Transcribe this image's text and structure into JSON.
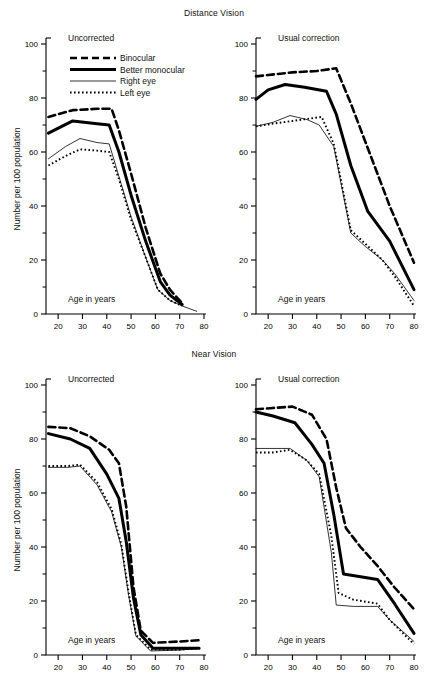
{
  "figure": {
    "width": 428,
    "height": 682,
    "background": "#ffffff",
    "ink": "#000000"
  },
  "sections": [
    {
      "title": "Distance Vision"
    },
    {
      "title": "Near Vision"
    }
  ],
  "panel_captions": {
    "uncorrected": "Uncorrected",
    "usual_correction": "Usual correction"
  },
  "axes": {
    "xlabel": "Age in years",
    "ylabel": "Number per 100 population",
    "xticks": [
      20,
      30,
      40,
      50,
      60,
      70,
      80
    ],
    "yticks": [
      0,
      20,
      40,
      60,
      80,
      100
    ],
    "yminorticks": [
      10,
      30,
      50,
      70,
      90
    ],
    "xlim": [
      15,
      80
    ],
    "ylim": [
      0,
      100
    ],
    "grid": false
  },
  "legend": {
    "position": "top-left-panel",
    "entries": [
      {
        "label": "Binocular",
        "style": "dashed-thick"
      },
      {
        "label": "Better monocular",
        "style": "solid-thick"
      },
      {
        "label": "Right eye",
        "style": "solid-thin"
      },
      {
        "label": "Left eye",
        "style": "dotted"
      }
    ]
  },
  "chart_data": [
    {
      "id": "distance-uncorrected",
      "type": "line",
      "title": "Distance Vision",
      "subtitle": "Uncorrected",
      "xlabel": "Age in years",
      "ylabel": "Number per 100 population",
      "xlim": [
        15,
        80
      ],
      "ylim": [
        0,
        100
      ],
      "grid": false,
      "series": [
        {
          "name": "Binocular",
          "style": "dashed-thick",
          "x": [
            16,
            26,
            36,
            42,
            45,
            50,
            56,
            62,
            66,
            71
          ],
          "y": [
            73,
            75.5,
            76,
            76,
            68,
            52,
            32,
            15,
            9,
            4
          ]
        },
        {
          "name": "Better monocular",
          "style": "solid-thick",
          "x": [
            16,
            26,
            36,
            41,
            45,
            50,
            56,
            62,
            66,
            71
          ],
          "y": [
            67,
            71.5,
            70.5,
            70,
            60,
            44,
            27,
            12,
            7,
            3.5
          ]
        },
        {
          "name": "Right eye",
          "style": "solid-thin",
          "x": [
            16,
            23,
            29,
            36,
            41,
            45,
            50,
            56,
            61,
            66,
            71,
            77
          ],
          "y": [
            57.5,
            62,
            65,
            63.5,
            63,
            51,
            36,
            21,
            9,
            5,
            3,
            1
          ]
        },
        {
          "name": "Left eye",
          "style": "dotted",
          "x": [
            16,
            23,
            29,
            36,
            41,
            45,
            50,
            56,
            61,
            66,
            71
          ],
          "y": [
            55,
            58.5,
            61,
            60.5,
            60,
            50,
            35,
            21,
            9,
            5,
            3
          ]
        }
      ]
    },
    {
      "id": "distance-usual-correction",
      "type": "line",
      "title": "Distance Vision",
      "subtitle": "Usual correction",
      "xlabel": "Age in years",
      "ylabel": "Number per 100 population",
      "xlim": [
        15,
        80
      ],
      "ylim": [
        0,
        100
      ],
      "grid": false,
      "series": [
        {
          "name": "Binocular",
          "style": "dashed-thick",
          "x": [
            15,
            20,
            30,
            40,
            48,
            54,
            62,
            70,
            80
          ],
          "y": [
            88,
            88.5,
            89.5,
            90,
            91,
            78,
            59,
            40,
            19
          ]
        },
        {
          "name": "Better monocular",
          "style": "solid-thick",
          "x": [
            15,
            20,
            27,
            35,
            44,
            48,
            54,
            61,
            70,
            80
          ],
          "y": [
            79.5,
            83,
            85,
            84,
            82.5,
            74,
            55,
            38,
            27,
            9
          ]
        },
        {
          "name": "Right eye",
          "style": "solid-thin",
          "x": [
            15,
            22,
            29,
            36,
            41,
            47,
            54,
            60,
            67,
            72,
            80
          ],
          "y": [
            69.5,
            71,
            73.5,
            72,
            70,
            62,
            30,
            25,
            20,
            15,
            5
          ]
        },
        {
          "name": "Left eye",
          "style": "dotted",
          "x": [
            15,
            22,
            30,
            38,
            42,
            47,
            54,
            60,
            67,
            72,
            80
          ],
          "y": [
            69.5,
            70.5,
            71.5,
            72.5,
            73,
            63,
            31,
            26,
            20,
            14,
            3
          ]
        }
      ]
    },
    {
      "id": "near-uncorrected",
      "type": "line",
      "title": "Near Vision",
      "subtitle": "Uncorrected",
      "xlabel": "Age in years",
      "ylabel": "Number per 100 population",
      "xlim": [
        15,
        80
      ],
      "ylim": [
        0,
        100
      ],
      "grid": false,
      "series": [
        {
          "name": "Binocular",
          "style": "dashed-thick",
          "x": [
            16,
            25,
            33,
            41,
            45,
            48,
            51,
            54,
            59,
            70,
            78
          ],
          "y": [
            84.5,
            84,
            81,
            76,
            71,
            55,
            25,
            9,
            4.5,
            5,
            5.5
          ]
        },
        {
          "name": "Better monocular",
          "style": "solid-thick",
          "x": [
            16,
            25,
            33,
            40,
            45,
            48,
            51,
            54,
            59,
            70,
            78
          ],
          "y": [
            82,
            80,
            76.5,
            67,
            58,
            42,
            21,
            7.5,
            2.5,
            2.5,
            2.5
          ]
        },
        {
          "name": "Right eye",
          "style": "solid-thin",
          "x": [
            16,
            24,
            29,
            36,
            42,
            46,
            49,
            52,
            58,
            70,
            78
          ],
          "y": [
            69.5,
            69.5,
            70,
            63,
            53,
            40,
            22,
            7,
            1.5,
            1.8,
            2.5
          ]
        },
        {
          "name": "Left eye",
          "style": "dotted",
          "x": [
            16,
            24,
            29,
            36,
            42,
            46,
            49,
            52,
            58,
            70,
            78
          ],
          "y": [
            70,
            70,
            70.5,
            64,
            54,
            41,
            23,
            7.5,
            2,
            2,
            2.5
          ]
        }
      ]
    },
    {
      "id": "near-usual-correction",
      "type": "line",
      "title": "Near Vision",
      "subtitle": "Usual correction",
      "xlabel": "Age in years",
      "ylabel": "Number per 100 population",
      "xlim": [
        15,
        80
      ],
      "ylim": [
        0,
        100
      ],
      "grid": false,
      "series": [
        {
          "name": "Binocular",
          "style": "dashed-thick",
          "x": [
            15,
            22,
            30,
            38,
            44,
            48,
            52,
            58,
            65,
            72,
            80
          ],
          "y": [
            91,
            91.5,
            92,
            89,
            80,
            62,
            47,
            40,
            33,
            25,
            17
          ]
        },
        {
          "name": "Better monocular",
          "style": "solid-thick",
          "x": [
            15,
            22,
            31,
            38,
            43,
            47,
            51,
            58,
            65,
            72,
            80
          ],
          "y": [
            90,
            88.5,
            86,
            78,
            71,
            52,
            30,
            29,
            28,
            19,
            8
          ]
        },
        {
          "name": "Right eye",
          "style": "solid-thin",
          "x": [
            15,
            22,
            29,
            36,
            41,
            46,
            48,
            55,
            65,
            70,
            80
          ],
          "y": [
            76.5,
            76.5,
            76.5,
            72,
            66,
            38,
            18.5,
            18,
            18,
            13,
            5
          ]
        },
        {
          "name": "Left eye",
          "style": "dotted",
          "x": [
            15,
            22,
            29,
            36,
            41,
            46,
            49,
            55,
            65,
            70,
            80
          ],
          "y": [
            75,
            75,
            76,
            72,
            67,
            44,
            23,
            20.5,
            19,
            13,
            4
          ]
        }
      ]
    }
  ]
}
